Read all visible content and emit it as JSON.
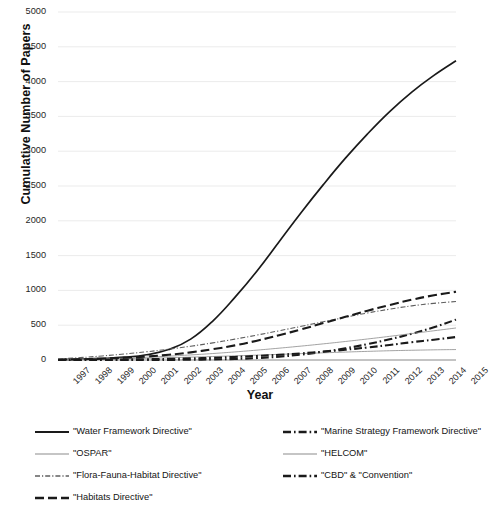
{
  "chart_data": {
    "type": "line",
    "title": "",
    "xlabel": "Year",
    "ylabel": "Cumulative Number of Papers",
    "grid": "horizontal",
    "legend_position": "bottom",
    "xlim": [
      1997,
      2015
    ],
    "ylim": [
      0,
      5000
    ],
    "ytick_step": 500,
    "categories": [
      "1997",
      "1998",
      "1999",
      "2000",
      "2001",
      "2002",
      "2003",
      "2004",
      "2005",
      "2006",
      "2007",
      "2008",
      "2009",
      "2010",
      "2011",
      "2012",
      "2013",
      "2014",
      "2015"
    ],
    "x": [
      1997,
      1998,
      1999,
      2000,
      2001,
      2002,
      2003,
      2004,
      2005,
      2006,
      2007,
      2008,
      2009,
      2010,
      2011,
      2012,
      2013,
      2014,
      2015
    ],
    "ytick_labels": [
      "0",
      "500",
      "1000",
      "1500",
      "2000",
      "2500",
      "3000",
      "3500",
      "4000",
      "4500",
      "5000"
    ],
    "series": [
      {
        "name": "\"Water Framework Directive\"",
        "style": "solid-thick",
        "color": "#1a1a1a",
        "values": [
          5,
          12,
          22,
          40,
          75,
          150,
          300,
          560,
          900,
          1280,
          1700,
          2120,
          2520,
          2900,
          3250,
          3570,
          3850,
          4090,
          4300
        ]
      },
      {
        "name": "\"Marine Strategy Framework Directive\"",
        "style": "dashdot-thick",
        "color": "#1a1a1a",
        "values": [
          0,
          0,
          0,
          0,
          1,
          2,
          4,
          8,
          15,
          28,
          48,
          78,
          118,
          168,
          228,
          298,
          378,
          470,
          580
        ]
      },
      {
        "name": "\"OSPAR\"",
        "style": "solid-thin-light",
        "color": "#8c8c8c",
        "values": [
          2,
          6,
          11,
          17,
          24,
          32,
          41,
          50,
          60,
          70,
          81,
          92,
          103,
          114,
          124,
          133,
          140,
          146,
          150
        ]
      },
      {
        "name": "\"HELCOM\"",
        "style": "solid-thin-light",
        "color": "#8c8c8c",
        "values": [
          3,
          9,
          17,
          27,
          40,
          55,
          73,
          93,
          116,
          142,
          170,
          200,
          232,
          266,
          302,
          340,
          380,
          420,
          460
        ]
      },
      {
        "name": "\"Flora-Fauna-Habitat Directive\"",
        "style": "dashdot-thin",
        "color": "#5f5f5f",
        "values": [
          14,
          34,
          58,
          86,
          118,
          155,
          198,
          246,
          300,
          358,
          420,
          484,
          550,
          614,
          676,
          730,
          778,
          814,
          840
        ]
      },
      {
        "name": "\"CBD\" & \"Convention\"",
        "style": "dashdot-thick",
        "color": "#1a1a1a",
        "values": [
          1,
          2,
          4,
          7,
          11,
          16,
          23,
          32,
          44,
          58,
          75,
          96,
          120,
          148,
          180,
          216,
          256,
          292,
          330
        ]
      },
      {
        "name": "\"Habitats Directive\"",
        "style": "dash-thick",
        "color": "#1a1a1a",
        "values": [
          4,
          10,
          19,
          32,
          50,
          75,
          110,
          155,
          210,
          278,
          356,
          440,
          530,
          620,
          708,
          790,
          866,
          930,
          980
        ]
      }
    ]
  },
  "axes": {
    "ylabel": "Cumulative Number of Papers",
    "xlabel": "Year"
  },
  "legend": {
    "items": [
      {
        "label": "\"Water Framework Directive\"",
        "style": "solid-thick",
        "col": 0,
        "row": 0
      },
      {
        "label": "\"Marine Strategy Framework Directive\"",
        "style": "dashdot-thick",
        "col": 1,
        "row": 0
      },
      {
        "label": "\"OSPAR\"",
        "style": "solid-thin-light",
        "col": 0,
        "row": 1
      },
      {
        "label": "\"HELCOM\"",
        "style": "solid-thin-light",
        "col": 1,
        "row": 1
      },
      {
        "label": "\"Flora-Fauna-Habitat Directive\"",
        "style": "dashdot-thin",
        "col": 0,
        "row": 2
      },
      {
        "label": "\"CBD\" & \"Convention\"",
        "style": "dashdot-thick",
        "col": 1,
        "row": 2
      },
      {
        "label": "\"Habitats Directive\"",
        "style": "dash-thick",
        "col": 0,
        "row": 3
      }
    ]
  }
}
